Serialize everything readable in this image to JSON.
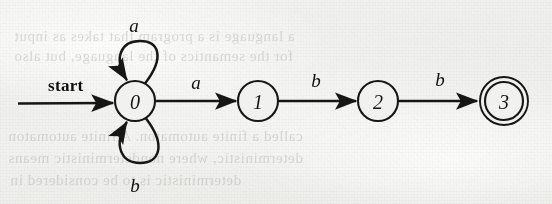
{
  "diagram": {
    "type": "finite-automaton",
    "title": "",
    "start_label": "start",
    "states": [
      {
        "id": "0",
        "label": "0",
        "cx": 135,
        "cy": 101,
        "r": 20,
        "accepting": false,
        "initial": true
      },
      {
        "id": "1",
        "label": "1",
        "cx": 258,
        "cy": 101,
        "r": 20,
        "accepting": false,
        "initial": false
      },
      {
        "id": "2",
        "label": "2",
        "cx": 378,
        "cy": 101,
        "r": 20,
        "accepting": false,
        "initial": false
      },
      {
        "id": "3",
        "label": "3",
        "cx": 504,
        "cy": 101,
        "r": 20,
        "accepting": true,
        "initial": false
      }
    ],
    "transitions": [
      {
        "from": "0",
        "to": "1",
        "label": "a",
        "kind": "edge",
        "label_x": 196,
        "label_y": 89
      },
      {
        "from": "1",
        "to": "2",
        "label": "b",
        "kind": "edge",
        "label_x": 316,
        "label_y": 87
      },
      {
        "from": "2",
        "to": "3",
        "label": "b",
        "kind": "edge",
        "label_x": 440,
        "label_y": 86
      },
      {
        "from": "0",
        "to": "0",
        "label": "a",
        "kind": "self-loop-top",
        "label_x": 134,
        "label_y": 32
      },
      {
        "from": "0",
        "to": "0",
        "label": "b",
        "kind": "self-loop-bottom",
        "label_x": 135,
        "label_y": 192
      }
    ],
    "alphabet": [
      "a",
      "b"
    ],
    "accepting_states": [
      "3"
    ],
    "initial_state": "0",
    "colors": {
      "ink": "#161616",
      "paper": "#f1f1ef",
      "bleed_text": "#8e8e8c"
    }
  },
  "bleed_through_text": {
    "line1": "a language is a program that takes as input",
    "line2": "for the semantics of the language, but also",
    "line3": "called a finite automaton. A finite automaton",
    "line4": "deterministic, where nondeterministic means",
    "line5": "deterministic is to be considered in"
  }
}
